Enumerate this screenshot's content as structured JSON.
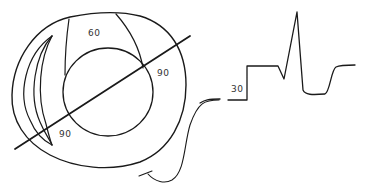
{
  "diagram": {
    "labels": {
      "top_region": "60",
      "right_region": "90",
      "lower_left_region": "90",
      "waveform_baseline": "30"
    },
    "colors": {
      "line": "#1a1a1a",
      "text": "#333333",
      "background": "#ffffff"
    }
  }
}
